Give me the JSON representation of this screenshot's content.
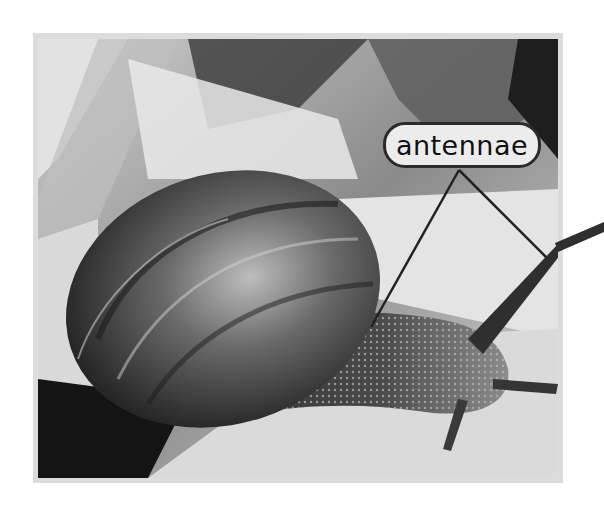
{
  "figure": {
    "style": "grayscale photograph",
    "callouts": [
      {
        "label": "antennae",
        "pointer_count": 2
      }
    ]
  }
}
